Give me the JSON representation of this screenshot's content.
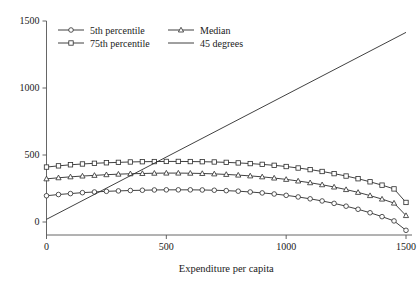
{
  "chart_data": {
    "type": "line",
    "title": "",
    "xlabel": "Expenditure per capita",
    "ylabel": "",
    "xlim": [
      -30,
      1550
    ],
    "ylim": [
      -130,
      1530
    ],
    "xticks": [
      0,
      500,
      1000,
      1500
    ],
    "yticks": [
      0,
      500,
      1000,
      1500
    ],
    "xtick_labels": [
      "0",
      "500",
      "1000",
      "1500"
    ],
    "ytick_labels": [
      "0",
      "500",
      "1000",
      "1500"
    ],
    "grid": false,
    "legend_position": "top-left",
    "x": [
      0,
      50,
      100,
      150,
      200,
      250,
      300,
      350,
      400,
      450,
      500,
      550,
      600,
      650,
      700,
      750,
      800,
      850,
      900,
      950,
      1000,
      1050,
      1100,
      1150,
      1200,
      1250,
      1300,
      1350,
      1400,
      1450,
      1500
    ],
    "series": [
      {
        "name": "5th percentile",
        "marker": "circle",
        "values": [
          196,
          205,
          212,
          219,
          224,
          229,
          232,
          235,
          237,
          239,
          240,
          240,
          240,
          239,
          237,
          234,
          230,
          224,
          217,
          209,
          199,
          187,
          173,
          157,
          139,
          118,
          95,
          69,
          40,
          8,
          -62
        ]
      },
      {
        "name": "Median",
        "marker": "triangle",
        "values": [
          322,
          330,
          337,
          343,
          348,
          353,
          357,
          360,
          362,
          364,
          365,
          365,
          364,
          362,
          359,
          355,
          350,
          344,
          337,
          328,
          318,
          306,
          293,
          278,
          261,
          242,
          221,
          197,
          171,
          141,
          48
        ]
      },
      {
        "name": "75th percentile",
        "marker": "square",
        "values": [
          410,
          419,
          427,
          433,
          438,
          442,
          445,
          448,
          450,
          451,
          452,
          452,
          451,
          450,
          448,
          445,
          441,
          436,
          430,
          423,
          414,
          403,
          391,
          377,
          361,
          343,
          323,
          300,
          275,
          247,
          146
        ]
      }
    ],
    "reference_line": {
      "name": "45 degrees",
      "marker": "none",
      "x": [
        0,
        1500
      ],
      "values": [
        20,
        1415
      ]
    },
    "legend": [
      {
        "label": "5th percentile",
        "marker": "circle"
      },
      {
        "label": "Median",
        "marker": "triangle"
      },
      {
        "label": "75th percentile",
        "marker": "square"
      },
      {
        "label": "45 degrees",
        "marker": "none"
      }
    ],
    "colors": {
      "line": "#2b2b2b",
      "axis": "#555555",
      "background": "#ffffff",
      "marker_fill": "#ffffff"
    }
  }
}
